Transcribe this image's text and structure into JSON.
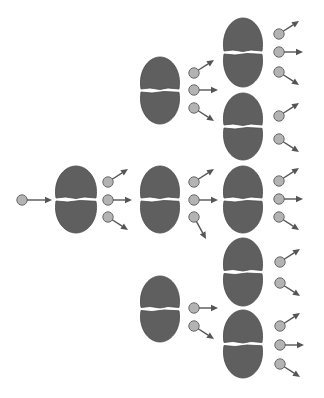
{
  "diagram": {
    "title": "",
    "colors": {
      "background": "#ffffff",
      "nucleus": "#5f5f5f",
      "neutron": "#b3b3b3",
      "arrow": "#555555"
    },
    "incoming_neutron": {
      "x": 22,
      "y": 200,
      "arrow_to": [
        52,
        200
      ]
    },
    "nuclei": [
      {
        "id": "g1-n1",
        "generation": 1,
        "cx": 76,
        "top": 166,
        "bottom": 233,
        "rx": 21,
        "neutrons": [
          {
            "x": 108,
            "y": 182,
            "dir": "up-right"
          },
          {
            "x": 108,
            "y": 200,
            "dir": "right"
          },
          {
            "x": 108,
            "y": 217,
            "dir": "down-right"
          }
        ]
      },
      {
        "id": "g2-n1",
        "generation": 2,
        "cx": 160,
        "top": 57,
        "bottom": 124,
        "rx": 20,
        "neutrons": [
          {
            "x": 194,
            "y": 73,
            "dir": "up-right"
          },
          {
            "x": 194,
            "y": 90,
            "dir": "right"
          },
          {
            "x": 194,
            "y": 108,
            "dir": "down-right"
          }
        ]
      },
      {
        "id": "g2-n2",
        "generation": 2,
        "cx": 160,
        "top": 166,
        "bottom": 233,
        "rx": 20,
        "neutrons": [
          {
            "x": 194,
            "y": 182,
            "dir": "up-right"
          },
          {
            "x": 194,
            "y": 200,
            "dir": "right"
          },
          {
            "x": 194,
            "y": 217,
            "dir": "down-right-steep"
          }
        ]
      },
      {
        "id": "g2-n3",
        "generation": 2,
        "cx": 160,
        "top": 276,
        "bottom": 342,
        "rx": 20,
        "neutrons": [
          {
            "x": 194,
            "y": 308,
            "dir": "right"
          },
          {
            "x": 194,
            "y": 326,
            "dir": "down-right"
          }
        ]
      },
      {
        "id": "g3-n1",
        "generation": 3,
        "cx": 243,
        "top": 18,
        "bottom": 87,
        "rx": 20,
        "neutrons": [
          {
            "x": 279,
            "y": 34,
            "dir": "up-right"
          },
          {
            "x": 279,
            "y": 52,
            "dir": "right"
          },
          {
            "x": 279,
            "y": 72,
            "dir": "down-right"
          }
        ]
      },
      {
        "id": "g3-n2",
        "generation": 3,
        "cx": 243,
        "top": 93,
        "bottom": 160,
        "rx": 20,
        "neutrons": [
          {
            "x": 279,
            "y": 116,
            "dir": "up-right"
          },
          {
            "x": 279,
            "y": 139,
            "dir": "down-right"
          }
        ]
      },
      {
        "id": "g3-n3",
        "generation": 3,
        "cx": 243,
        "top": 166,
        "bottom": 233,
        "rx": 20,
        "neutrons": [
          {
            "x": 279,
            "y": 181,
            "dir": "up-right"
          },
          {
            "x": 279,
            "y": 199,
            "dir": "right"
          },
          {
            "x": 279,
            "y": 217,
            "dir": "down-right"
          }
        ]
      },
      {
        "id": "g3-n4",
        "generation": 3,
        "cx": 243,
        "top": 238,
        "bottom": 306,
        "rx": 20,
        "neutrons": [
          {
            "x": 280,
            "y": 262,
            "dir": "up-right"
          },
          {
            "x": 280,
            "y": 283,
            "dir": "down-right"
          }
        ]
      },
      {
        "id": "g3-n5",
        "generation": 3,
        "cx": 243,
        "top": 310,
        "bottom": 378,
        "rx": 20,
        "neutrons": [
          {
            "x": 280,
            "y": 326,
            "dir": "up-right"
          },
          {
            "x": 280,
            "y": 345,
            "dir": "right"
          },
          {
            "x": 280,
            "y": 364,
            "dir": "down-right"
          }
        ]
      }
    ],
    "counts": {
      "generations": 3,
      "nuclei_per_generation": [
        1,
        3,
        5
      ],
      "total_nuclei": 9
    }
  }
}
